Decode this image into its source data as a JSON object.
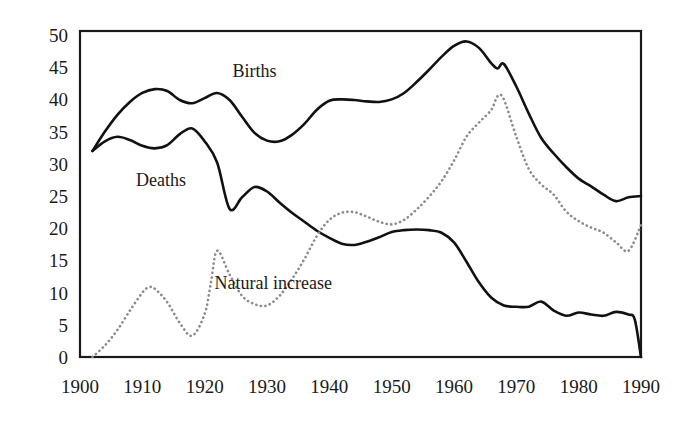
{
  "chart_data": {
    "type": "line",
    "title": "",
    "subtitle": "",
    "xlabel": "",
    "ylabel": "",
    "xlim": [
      1900,
      1990
    ],
    "ylim": [
      0,
      50
    ],
    "grid": false,
    "legend_position": "inline-annotations",
    "x_ticks": [
      "1900",
      "1910",
      "1920",
      "1930",
      "1940",
      "1950",
      "1960",
      "1970",
      "1980",
      "1990"
    ],
    "y_ticks": [
      "0",
      "5",
      "10",
      "15",
      "20",
      "25",
      "30",
      "35",
      "40",
      "45",
      "50"
    ],
    "annotations": [
      {
        "name": "births-label",
        "text": "Births",
        "x": 1928,
        "y": 43.5
      },
      {
        "name": "deaths-label",
        "text": "Deaths",
        "x": 1913,
        "y": 26.5
      },
      {
        "name": "natural-increase-label",
        "text": "Natural increase",
        "x": 1931,
        "y": 10.5
      }
    ],
    "series": [
      {
        "name": "Births",
        "style": "solid",
        "color": "#111111",
        "x": [
          1902,
          1904,
          1906,
          1908,
          1910,
          1912,
          1914,
          1916,
          1918,
          1920,
          1922,
          1924,
          1926,
          1928,
          1930,
          1932,
          1934,
          1936,
          1938,
          1940,
          1942,
          1944,
          1946,
          1948,
          1950,
          1952,
          1954,
          1956,
          1958,
          1960,
          1962,
          1964,
          1966,
          1967,
          1968,
          1970,
          1972,
          1974,
          1976,
          1978,
          1980,
          1982,
          1984,
          1986,
          1988,
          1990
        ],
        "values": [
          32.0,
          35.0,
          37.6,
          39.6,
          41.0,
          41.6,
          41.3,
          39.9,
          39.4,
          40.2,
          41.0,
          39.9,
          37.3,
          34.8,
          33.6,
          33.5,
          34.5,
          36.2,
          38.4,
          39.8,
          40.0,
          39.9,
          39.7,
          39.6,
          40.0,
          41.0,
          42.7,
          44.6,
          46.6,
          48.3,
          49.0,
          48.0,
          45.6,
          44.8,
          45.5,
          42.0,
          37.8,
          34.0,
          31.6,
          29.5,
          27.7,
          26.5,
          25.2,
          24.2,
          24.8,
          25.0
        ]
      },
      {
        "name": "Deaths",
        "style": "solid",
        "color": "#111111",
        "x": [
          1902,
          1904,
          1906,
          1908,
          1910,
          1912,
          1914,
          1916,
          1918,
          1920,
          1922,
          1924,
          1926,
          1928,
          1930,
          1932,
          1934,
          1936,
          1938,
          1940,
          1942,
          1944,
          1946,
          1948,
          1950,
          1952,
          1954,
          1956,
          1958,
          1960,
          1962,
          1964,
          1966,
          1968,
          1970,
          1972,
          1974,
          1976,
          1978,
          1980,
          1982,
          1984,
          1986,
          1988,
          1989,
          1990
        ],
        "values": [
          32.0,
          33.5,
          34.2,
          33.7,
          32.8,
          32.4,
          32.9,
          34.6,
          35.5,
          33.5,
          30.2,
          23.0,
          24.8,
          26.4,
          25.7,
          24.0,
          22.4,
          21.0,
          19.6,
          18.5,
          17.6,
          17.4,
          17.9,
          18.6,
          19.4,
          19.7,
          19.8,
          19.7,
          19.3,
          17.8,
          14.8,
          11.6,
          9.2,
          8.0,
          7.8,
          7.8,
          8.6,
          7.2,
          6.4,
          6.9,
          6.6,
          6.4,
          7.0,
          6.6,
          5.8,
          0.0
        ]
      },
      {
        "name": "Natural increase",
        "style": "dotted",
        "color": "#8c8c8c",
        "x": [
          1902,
          1904,
          1906,
          1908,
          1910,
          1911,
          1912,
          1914,
          1916,
          1918,
          1920,
          1921,
          1922,
          1924,
          1926,
          1928,
          1930,
          1932,
          1934,
          1936,
          1938,
          1940,
          1942,
          1944,
          1946,
          1948,
          1950,
          1952,
          1954,
          1956,
          1958,
          1960,
          1962,
          1964,
          1966,
          1967,
          1968,
          1970,
          1972,
          1974,
          1976,
          1978,
          1980,
          1982,
          1984,
          1986,
          1988,
          1990
        ],
        "values": [
          0.0,
          1.8,
          4.2,
          7.2,
          10.0,
          10.8,
          10.6,
          8.5,
          5.3,
          3.3,
          6.7,
          11.5,
          16.5,
          12.8,
          9.5,
          8.2,
          8.0,
          9.5,
          12.1,
          15.2,
          18.8,
          21.3,
          22.4,
          22.5,
          21.8,
          21.0,
          20.6,
          21.3,
          22.9,
          24.9,
          27.3,
          30.5,
          34.2,
          36.4,
          38.4,
          40.5,
          40.0,
          34.2,
          29.2,
          26.8,
          25.2,
          22.6,
          21.1,
          20.1,
          19.3,
          17.8,
          16.5,
          20.5
        ]
      }
    ]
  }
}
